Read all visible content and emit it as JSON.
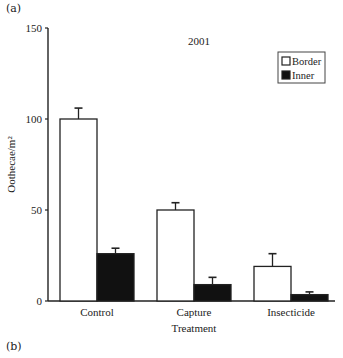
{
  "panel_labels": {
    "top": "(a)",
    "bottom": "(b)"
  },
  "chart_data": {
    "type": "bar",
    "title": "2001",
    "xlabel": "Treatment",
    "ylabel": "Oothecae/m²",
    "ylim": [
      0,
      150
    ],
    "yticks": [
      0,
      50,
      100,
      150
    ],
    "grid": false,
    "legend_position": "upper right",
    "categories": [
      "Control",
      "Capture",
      "Insecticide"
    ],
    "series": [
      {
        "name": "Border",
        "fill": "#ffffff",
        "values": [
          100,
          50,
          19
        ],
        "error_upper": [
          106,
          54,
          26
        ]
      },
      {
        "name": "Inner",
        "fill": "#111111",
        "values": [
          26,
          9,
          3.5
        ],
        "error_upper": [
          29,
          13,
          5
        ]
      }
    ]
  }
}
